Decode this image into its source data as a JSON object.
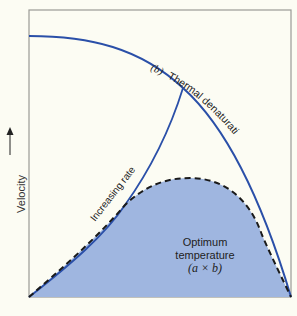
{
  "diagram": {
    "y_axis_label": "Velocity",
    "y_axis_arrow": "up-arrow",
    "curves": {
      "thermal": {
        "label_prefix": "(b)",
        "label": "Thermal denaturation",
        "color": "#2a4fa8"
      },
      "increasing": {
        "label": "Increasing rate",
        "color": "#2a4fa8"
      },
      "combined": {
        "style": "dashed",
        "color": "#1a1a1a",
        "fill": "#9fb6e0"
      }
    },
    "region_label": {
      "line1": "Optimum",
      "line2": "temperature",
      "formula": "(a × b)"
    },
    "colors": {
      "background": "#fcfcf3",
      "frame": "#9a9a96",
      "fill": "#9fb6e0",
      "curve": "#2a4fa8"
    }
  }
}
